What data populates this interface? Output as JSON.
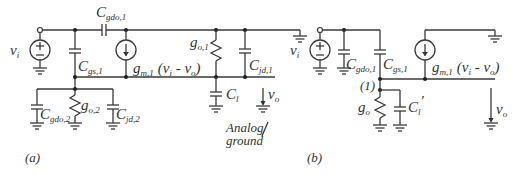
{
  "figure": {
    "panel_a": {
      "caption": "(a)",
      "labels": {
        "vi": {
          "main": "v",
          "sub": "i"
        },
        "cgdo1": {
          "main": "C",
          "sub": "gdo,1"
        },
        "cgs1": {
          "main": "C",
          "sub": "gs,1"
        },
        "gm1": {
          "main": "g",
          "sub": "m,1",
          "tail": "(v",
          "tail_sub": "i",
          "tail2": " - v",
          "tail2_sub": "o",
          "tail3": ")"
        },
        "go1": {
          "main": "g",
          "sub": "o,1"
        },
        "cjd1": {
          "main": "C",
          "sub": "jd,1"
        },
        "cl": {
          "main": "C",
          "sub": "l"
        },
        "vo": {
          "main": "v",
          "sub": "o"
        },
        "cgdo2": {
          "main": "C",
          "sub": "gdo,2"
        },
        "go2": {
          "main": "g",
          "sub": "o,2"
        },
        "cjd2": {
          "main": "C",
          "sub": "jd,2"
        },
        "analog_ground_line1": "Analog",
        "analog_ground_line2": "ground"
      }
    },
    "panel_b": {
      "caption": "(b)",
      "labels": {
        "vi": {
          "main": "v",
          "sub": "i"
        },
        "cgdo1": {
          "main": "C",
          "sub": "gdo,1"
        },
        "cgs1": {
          "main": "C",
          "sub": "gs,1"
        },
        "node": "(1)",
        "gm1": {
          "main": "g",
          "sub": "m,1",
          "tail": "(v",
          "tail_sub": "i",
          "tail2": " - v",
          "tail2_sub": "o",
          "tail3": ")"
        },
        "go": {
          "main": "g",
          "sub": "o"
        },
        "cl_prime": {
          "main": "C",
          "sub": "l",
          "prime": "′"
        },
        "vo": {
          "main": "v",
          "sub": "o"
        }
      }
    }
  }
}
